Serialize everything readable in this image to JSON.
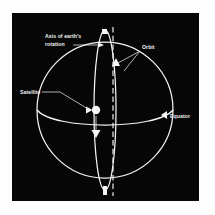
{
  "figure": {
    "kind": "astronomy-diagram",
    "background_color": "#050505",
    "line_color": "#f4f4f4",
    "page_color": "#fdfdfd"
  },
  "labels": {
    "axis": {
      "line1": "Axis of earth's",
      "line2": "rotation",
      "name": "axis-of-earths-rotation"
    },
    "orbit": {
      "text": "Orbit",
      "name": "orbit"
    },
    "satellite": {
      "text": "Satellite",
      "name": "satellite"
    },
    "equator": {
      "text": "Equator",
      "name": "equator"
    }
  },
  "markers": {
    "satellite_dot": "satellite-body",
    "satellite_direction_arrow": "downward-travel-arrow",
    "orbit_direction_arrow": "upward-orbit-arrow",
    "equator_pointer": "left-pointing-triangle",
    "north_pole_marker": "north-pole-node"
  },
  "geometry": {
    "earth_center_x": 93,
    "earth_center_y": 97,
    "earth_radius": 68,
    "orbit_semi_minor": 10,
    "orbit_semi_major": 80,
    "equator_curve_rise": 17,
    "axis_top_y": 14,
    "axis_bottom_y": 182
  }
}
